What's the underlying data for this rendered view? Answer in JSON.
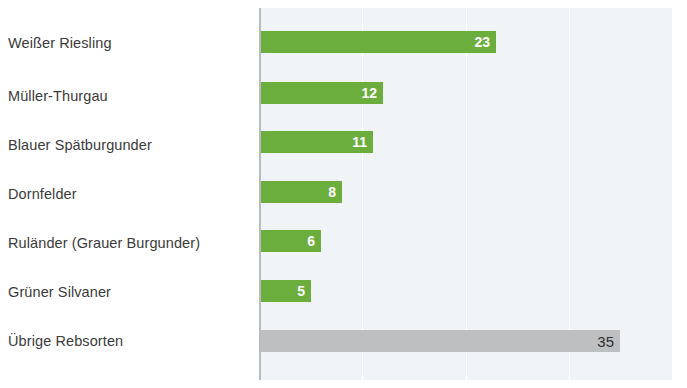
{
  "chart_data": {
    "type": "bar",
    "orientation": "horizontal",
    "title": "",
    "subtitle": "",
    "xlabel": "",
    "ylabel": "",
    "categories": [
      "Weißer Riesling",
      "Müller-Thurgau",
      "Blauer Spätburgunder",
      "Dornfelder",
      "Ruländer (Grauer Burgunder)",
      "Grüner Silvaner",
      "Übrige Rebsorten"
    ],
    "values": [
      23,
      12,
      11,
      8,
      6,
      5,
      35
    ],
    "value_labels": [
      "23",
      "12",
      "11",
      "8",
      "6",
      "5",
      "35"
    ],
    "bar_colors": [
      "#6cae3e",
      "#6cae3e",
      "#6cae3e",
      "#6cae3e",
      "#6cae3e",
      "#6cae3e",
      "#bdbfc1"
    ],
    "xlim": [
      0,
      40
    ],
    "grid": true,
    "gridlines_at": [
      10,
      20,
      30,
      40
    ],
    "legend": null,
    "annotations": [],
    "plot_background": "#f1f4f6",
    "axis_color": "#b6bcc0",
    "accent_color": "#6cae3e",
    "muted_color": "#bdbfc1",
    "label_color": "#3b3b3b"
  },
  "axis": {
    "tick_labels": []
  }
}
